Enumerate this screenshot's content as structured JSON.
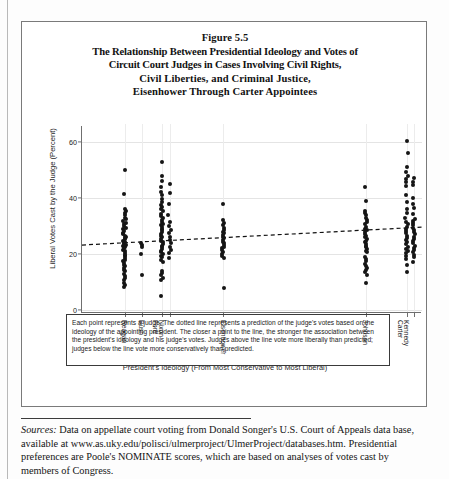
{
  "figure": {
    "title_lines": [
      "Figure 5.5",
      "The Relationship Between Presidential Ideology and Votes of",
      "Circuit Court Judges in Cases Involving Civil Rights,",
      "Civil Liberties, and Criminal Justice,",
      "Eisenhower Through Carter Appointees"
    ],
    "note": "Each point represents a judge. The dotted line represents a prediction of the judge's votes based on the ideology of the appointing president. The closer a point to the line, the stronger the association between the president's ideology and his judge's votes. Judges above the line vote more liberally than predicted; judges below the line vote more conservatively than predicted.",
    "sources_label": "Sources:",
    "sources_text": " Data on appellate court voting from Donald Songer's U.S. Court of Appeals data base, available at www.as.uky.edu/polisci/ulmerproject/UlmerProject/databases.htm. Presidential preferences are Poole's NOMINATE scores, which are based on analyses of votes cast by members of Congress."
  },
  "chart_data": {
    "type": "scatter",
    "xlabel": "President's Ideology (From Most Conservative to Most Liberal)",
    "ylabel": "Liberal Votes Cast by the Judge (Percent)",
    "ylim": [
      0,
      65
    ],
    "yticks": [
      0,
      20,
      40,
      60
    ],
    "ytick_labels": [
      "0",
      "20",
      "40",
      "60"
    ],
    "xlim": [
      0,
      100
    ],
    "grid": true,
    "legend": "none",
    "line_style": "dashed",
    "trendline": {
      "name": "Predicted liberal votes",
      "x": [
        0,
        100
      ],
      "y": [
        23.2,
        29.6
      ]
    },
    "xticks": [
      {
        "pos": 12.5,
        "label": "Reagan",
        "sub": ""
      },
      {
        "pos": 17.5,
        "label": "Bush",
        "sub": ""
      },
      {
        "pos": 23.5,
        "label": "Nixon",
        "sub": "Ford"
      },
      {
        "pos": 25.8,
        "label": "",
        "sub": ""
      },
      {
        "pos": 41.5,
        "label": "Eisenhower",
        "sub": ""
      },
      {
        "pos": 83.5,
        "label": "Johnson",
        "sub": ""
      },
      {
        "pos": 95.5,
        "label": "Kennedy",
        "sub": "Carter"
      },
      {
        "pos": 97.6,
        "label": "",
        "sub": ""
      }
    ],
    "groups": [
      {
        "name": "Reagan",
        "x": 12.5,
        "values": [
          50.0,
          41.5,
          36.2,
          35.4,
          34.6,
          33.8,
          33.0,
          32.4,
          31.8,
          31.2,
          30.6,
          30.0,
          29.4,
          28.8,
          28.2,
          27.6,
          27.0,
          26.4,
          26.0,
          25.6,
          25.2,
          24.8,
          24.4,
          24.0,
          23.6,
          23.2,
          22.8,
          22.4,
          22.0,
          21.6,
          21.0,
          20.4,
          19.8,
          19.2,
          18.6,
          18.0,
          17.4,
          16.8,
          16.2,
          15.6,
          15.0,
          14.4,
          13.8,
          13.0,
          12.2,
          11.4,
          10.6,
          9.8,
          9.0,
          8.2
        ]
      },
      {
        "name": "Bush",
        "x": 17.5,
        "values": [
          24.0,
          23.2,
          22.6,
          20.0,
          12.4
        ]
      },
      {
        "name": "Nixon",
        "x": 23.5,
        "values": [
          53.0,
          47.8,
          46.2,
          43.8,
          42.2,
          41.0,
          39.6,
          38.6,
          37.6,
          36.8,
          36.0,
          35.2,
          34.4,
          33.6,
          32.8,
          32.0,
          31.4,
          30.8,
          30.2,
          29.6,
          29.0,
          28.4,
          27.8,
          27.2,
          26.6,
          26.0,
          25.4,
          24.8,
          24.2,
          23.6,
          23.0,
          22.4,
          21.8,
          21.2,
          20.6,
          20.0,
          19.4,
          18.8,
          18.0,
          17.0,
          14.0,
          13.2,
          12.4,
          11.6,
          10.8,
          5.0
        ]
      },
      {
        "name": "Ford",
        "x": 25.8,
        "values": [
          45.0,
          41.8,
          38.0,
          34.0,
          31.6,
          30.0,
          28.6,
          27.4,
          26.2,
          25.0,
          23.8,
          22.6,
          21.4,
          20.2,
          18.6
        ]
      },
      {
        "name": "Eisenhower",
        "x": 41.5,
        "values": [
          38.0,
          32.0,
          31.0,
          30.2,
          29.4,
          28.6,
          28.0,
          27.4,
          26.8,
          26.2,
          25.6,
          25.0,
          24.4,
          23.8,
          23.2,
          22.6,
          22.0,
          21.4,
          20.8,
          20.0,
          19.2,
          18.4,
          8.0
        ]
      },
      {
        "name": "Johnson",
        "x": 83.5,
        "values": [
          44.0,
          38.8,
          35.4,
          34.6,
          33.8,
          33.0,
          32.2,
          31.4,
          30.6,
          29.8,
          29.0,
          28.4,
          27.8,
          27.2,
          26.6,
          26.0,
          25.4,
          24.8,
          24.2,
          23.6,
          23.0,
          22.4,
          21.8,
          21.2,
          20.6,
          19.0,
          18.2,
          17.4,
          16.6,
          15.8,
          15.0,
          14.2,
          13.4,
          12.6,
          9.6
        ]
      },
      {
        "name": "Kennedy",
        "x": 95.5,
        "values": [
          60.4,
          56.2,
          51.0,
          49.4,
          47.8,
          46.8,
          45.8,
          44.4,
          41.2,
          38.6,
          36.0,
          34.8,
          33.0,
          31.4,
          30.6,
          29.8,
          29.0,
          28.2,
          27.4,
          26.6,
          25.8,
          25.0,
          24.2,
          23.4,
          22.6,
          21.8,
          21.0,
          20.2,
          19.4,
          18.2,
          16.0,
          13.6
        ]
      },
      {
        "name": "Carter",
        "x": 97.6,
        "values": [
          47.0,
          45.6,
          44.6,
          40.0,
          38.0,
          36.4,
          34.2,
          32.6,
          31.8,
          31.0,
          30.2,
          29.4,
          28.6,
          27.8,
          27.0,
          26.2,
          25.4,
          24.6,
          23.8,
          23.0,
          22.2,
          21.4,
          20.6,
          19.8,
          18.8,
          17.2
        ]
      }
    ]
  }
}
